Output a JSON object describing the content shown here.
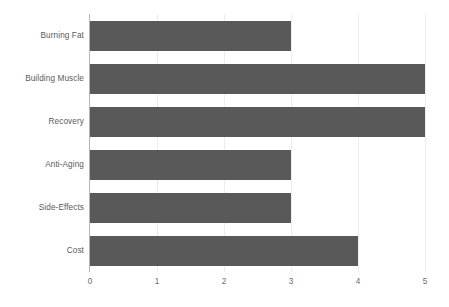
{
  "chart_data": {
    "type": "bar",
    "orientation": "horizontal",
    "title": "",
    "subtitle": "",
    "xlabel": "",
    "ylabel": "",
    "categories": [
      "Burning Fat",
      "Building Muscle",
      "Recovery",
      "Anti-Aging",
      "Side-Effects",
      "Cost"
    ],
    "values": [
      3,
      5,
      5,
      3,
      3,
      4
    ],
    "series": [
      {
        "name": "",
        "values": [
          3,
          5,
          5,
          3,
          3,
          4
        ]
      }
    ],
    "xlim": [
      0,
      5
    ],
    "x_ticks": [
      0,
      1,
      2,
      3,
      4,
      5
    ],
    "x_tick_labels": [
      "0",
      "1",
      "2",
      "3",
      "4",
      "5"
    ],
    "y_tick_labels": [
      "Burning Fat",
      "Building Muscle",
      "Recovery",
      "Anti-Aging",
      "Side-Effects",
      "Cost"
    ],
    "grid": true,
    "grid_axis": "x",
    "legend": false,
    "legend_position": "none",
    "annotations": [],
    "data_labels": false
  },
  "colors": {
    "bar_fill": "#595959",
    "gridline": "#ededed",
    "axis_line": "#b5b5b5",
    "label_text": "#5a5a5a",
    "tick_text": "#6a6a6a",
    "background": "#ffffff"
  }
}
